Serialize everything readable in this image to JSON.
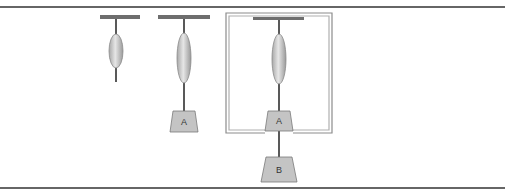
{
  "diagram": {
    "colors": {
      "frame_line": "#333333",
      "ceiling_bar": "#6e6e6e",
      "string": "#222222",
      "spring_fill": "#c8c8c8",
      "spring_stroke": "#8a8a8a",
      "weight_fill": "#c4c4c4",
      "weight_stroke": "#7a7a7a",
      "box_outer": "#8c8c8c",
      "box_inner": "#b0b0b0"
    },
    "setups": [
      {
        "name": "unloaded",
        "weights": []
      },
      {
        "name": "loaded-A",
        "weights": [
          {
            "label": "A"
          }
        ]
      },
      {
        "name": "boxed-A-with-B",
        "weights": [
          {
            "label": "A"
          },
          {
            "label": "B"
          }
        ]
      }
    ]
  }
}
